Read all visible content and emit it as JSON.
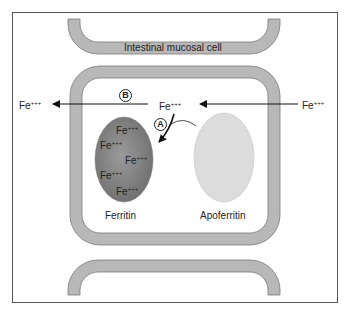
{
  "diagram": {
    "title_label": "Intestinal mucosal cell",
    "ion": {
      "base": "Fe",
      "charge": "+++"
    },
    "ion_labels": {
      "left_outside": "Fe",
      "center": "Fe",
      "right_outside": "Fe"
    },
    "ferritin_contents": [
      "Fe",
      "Fe",
      "Fe",
      "Fe",
      "Fe"
    ],
    "charge": "+++",
    "structures": {
      "ferritin": "Ferritin",
      "apoferritin": "Apoferritin"
    },
    "pathways": {
      "a": "A",
      "b": "B"
    },
    "colors": {
      "frame": "#555555",
      "membrane_fill": "#b8b8b8",
      "membrane_stroke": "#777777",
      "ferritin_fill": "#8a8a8a",
      "ferritin_edge": "#6e6e6e",
      "apoferritin_fill": "#dcdcdc",
      "arrow": "#111111"
    }
  }
}
